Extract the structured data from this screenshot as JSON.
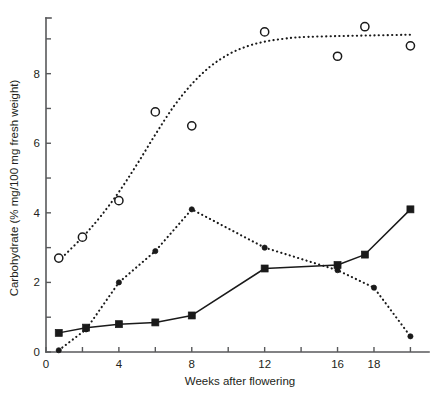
{
  "chart_data": {
    "type": "line",
    "title": "",
    "subtitle": "",
    "xlabel": "Weeks after flowering",
    "ylabel": "Carbohydrate (% mg/100 mg fresh weight)",
    "xlim": [
      0,
      20.8
    ],
    "ylim": [
      0,
      9.6
    ],
    "grid": false,
    "legend_position": "none",
    "x_ticks": [
      0,
      2,
      4,
      6,
      8,
      10,
      12,
      14,
      16,
      18,
      20
    ],
    "x_tick_labels": [
      "0",
      "",
      "4",
      "",
      "8",
      "",
      "12",
      "",
      "16",
      "18",
      ""
    ],
    "y_ticks": [
      0,
      1,
      2,
      3,
      4,
      5,
      6,
      7,
      8,
      9
    ],
    "y_tick_labels": [
      "0",
      "",
      "2",
      "",
      "4",
      "",
      "6",
      "",
      "8",
      ""
    ],
    "series": [
      {
        "name": "open-circle-series",
        "marker": "open-circle",
        "line_style": "dotted",
        "points": [
          {
            "x": 0.7,
            "y": 2.7
          },
          {
            "x": 2.0,
            "y": 3.3
          },
          {
            "x": 4.0,
            "y": 4.35
          },
          {
            "x": 6.0,
            "y": 6.9
          },
          {
            "x": 8.0,
            "y": 6.5
          },
          {
            "x": 12.0,
            "y": 9.2
          },
          {
            "x": 16.0,
            "y": 8.5
          },
          {
            "x": 17.5,
            "y": 9.35
          },
          {
            "x": 20.0,
            "y": 8.8
          }
        ],
        "fit_curve": [
          {
            "x": 0.7,
            "y": 2.62
          },
          {
            "x": 2.0,
            "y": 3.3
          },
          {
            "x": 3.0,
            "y": 3.9
          },
          {
            "x": 4.0,
            "y": 4.6
          },
          {
            "x": 5.0,
            "y": 5.4
          },
          {
            "x": 6.0,
            "y": 6.25
          },
          {
            "x": 7.0,
            "y": 7.05
          },
          {
            "x": 8.0,
            "y": 7.7
          },
          {
            "x": 9.0,
            "y": 8.2
          },
          {
            "x": 10.0,
            "y": 8.55
          },
          {
            "x": 11.0,
            "y": 8.78
          },
          {
            "x": 12.0,
            "y": 8.92
          },
          {
            "x": 13.0,
            "y": 9.0
          },
          {
            "x": 14.0,
            "y": 9.05
          },
          {
            "x": 16.0,
            "y": 9.08
          },
          {
            "x": 18.0,
            "y": 9.1
          },
          {
            "x": 20.0,
            "y": 9.12
          }
        ]
      },
      {
        "name": "filled-circle-series",
        "marker": "filled-circle",
        "line_style": "dotted",
        "points": [
          {
            "x": 0.7,
            "y": 0.05
          },
          {
            "x": 2.2,
            "y": 0.65
          },
          {
            "x": 4.0,
            "y": 2.0
          },
          {
            "x": 6.0,
            "y": 2.9
          },
          {
            "x": 8.0,
            "y": 4.1
          },
          {
            "x": 12.0,
            "y": 3.0
          },
          {
            "x": 16.0,
            "y": 2.35
          },
          {
            "x": 18.0,
            "y": 1.85
          },
          {
            "x": 20.0,
            "y": 0.45
          }
        ]
      },
      {
        "name": "filled-square-series",
        "marker": "filled-square",
        "line_style": "solid",
        "points": [
          {
            "x": 0.7,
            "y": 0.55
          },
          {
            "x": 2.2,
            "y": 0.7
          },
          {
            "x": 4.0,
            "y": 0.8
          },
          {
            "x": 6.0,
            "y": 0.85
          },
          {
            "x": 8.0,
            "y": 1.05
          },
          {
            "x": 12.0,
            "y": 2.4
          },
          {
            "x": 16.0,
            "y": 2.5
          },
          {
            "x": 17.5,
            "y": 2.8
          },
          {
            "x": 20.0,
            "y": 4.1
          }
        ]
      }
    ],
    "colors": {
      "ink": "#1a1a1a",
      "axis": "#58595b",
      "background": "#ffffff"
    }
  }
}
